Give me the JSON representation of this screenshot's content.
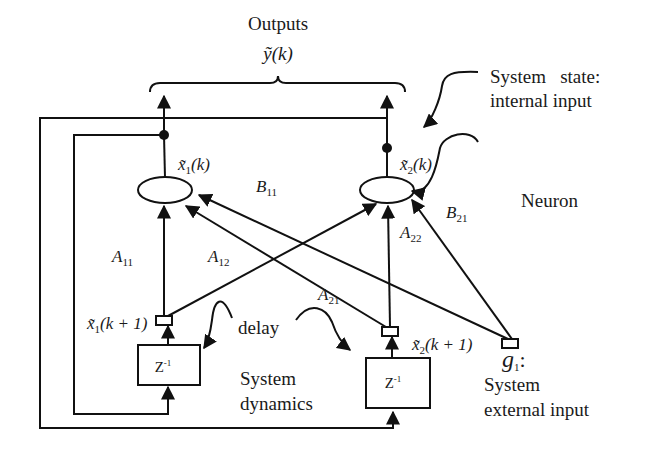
{
  "diagram": {
    "title": "Outputs",
    "output_symbol": "ỹ(k)",
    "annotations": {
      "system_state_line1": "System   state:",
      "system_state_line2": "internal input",
      "neuron": "Neuron",
      "delay": "delay",
      "system_dynamics_line1": "System",
      "system_dynamics_line2": "dynamics",
      "external_symbol": "g",
      "external_symbol_sub": "1",
      "external_colon": ":",
      "external_line1": "System",
      "external_line2": "external input"
    },
    "neurons": [
      {
        "state_label": "x̃",
        "sub": "1",
        "arg": "(k)"
      },
      {
        "state_label": "x̃",
        "sub": "2",
        "arg": "(k)"
      }
    ],
    "next_states": [
      {
        "label": "x̃",
        "sub": "1",
        "arg": "(k + 1)"
      },
      {
        "label": "x̃",
        "sub": "2",
        "arg": "(k + 1)"
      }
    ],
    "delay_blocks": [
      {
        "label": "Z",
        "sup": "-1"
      },
      {
        "label": "Z",
        "sup": "-1"
      }
    ],
    "weights": {
      "A11": {
        "base": "A",
        "sub": "11"
      },
      "A12": {
        "base": "A",
        "sub": "12"
      },
      "A21": {
        "base": "A",
        "sub": "21"
      },
      "A22": {
        "base": "A",
        "sub": "22"
      },
      "B11": {
        "base": "B",
        "sub": "11"
      },
      "B21": {
        "base": "B",
        "sub": "21"
      }
    }
  }
}
